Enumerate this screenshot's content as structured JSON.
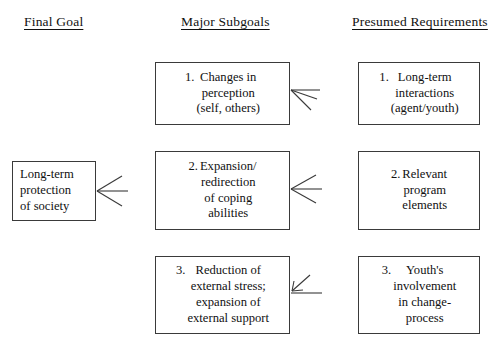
{
  "diagram": {
    "background_color": "#ffffff",
    "line_color": "#3a3a3a",
    "text_color": "#111111",
    "columns": [
      {
        "id": "final-goal",
        "label": "Final Goal"
      },
      {
        "id": "major-subgoals",
        "label": "Major Subgoals"
      },
      {
        "id": "presumed-requirements",
        "label": "Presumed Requirements"
      }
    ],
    "final_goal": {
      "number": "",
      "text": "Long-term\nprotection\nof society"
    },
    "subgoals": [
      {
        "number": "1.",
        "text": "Changes in\nperception\n(self, others)"
      },
      {
        "number": "2.",
        "text": "Expansion/\nredirection\nof coping\nabilities"
      },
      {
        "number": "3.",
        "text": "Reduction of\nexternal stress;\nexpansion of\nexternal support"
      }
    ],
    "requirements": [
      {
        "number": "1.",
        "text": "Long-term\ninteractions\n(agent/youth)"
      },
      {
        "number": "2.",
        "text": "Relevant\nprogram\nelements"
      },
      {
        "number": "3.",
        "text": "Youth's\ninvolvement\nin change-\nprocess"
      }
    ],
    "arrows": [
      {
        "id": "arrow-to-final-goal",
        "direction": "left",
        "style": "single"
      },
      {
        "id": "arrow-to-subgoal-1",
        "direction": "left",
        "style": "fan"
      },
      {
        "id": "arrow-to-subgoal-2",
        "direction": "left",
        "style": "single"
      },
      {
        "id": "arrow-to-subgoal-3",
        "direction": "up-left",
        "style": "diagonal"
      }
    ]
  }
}
